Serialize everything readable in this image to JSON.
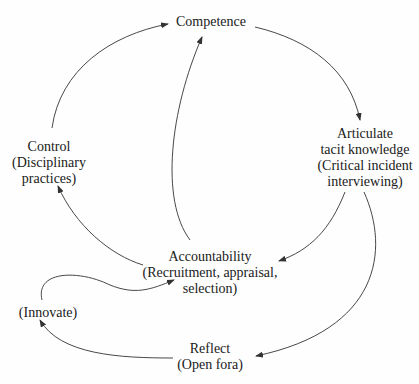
{
  "diagram": {
    "type": "cycle-flow",
    "nodes": {
      "competence": {
        "lines": [
          "Competence"
        ]
      },
      "articulate": {
        "lines": [
          "Articulate",
          "tacit knowledge",
          "(Critical incident",
          "interviewing)"
        ]
      },
      "accountability": {
        "lines": [
          "Accountability",
          "(Recruitment, appraisal,",
          "selection)"
        ]
      },
      "control": {
        "lines": [
          "Control",
          "(Disciplinary",
          "practices)"
        ]
      },
      "innovate": {
        "lines": [
          "(Innovate)"
        ]
      },
      "reflect": {
        "lines": [
          "Reflect",
          "(Open fora)"
        ]
      }
    },
    "edges": [
      {
        "from": "Competence",
        "to": "Articulate tacit knowledge"
      },
      {
        "from": "Articulate tacit knowledge",
        "to": "Accountability"
      },
      {
        "from": "Articulate tacit knowledge",
        "to": "Reflect"
      },
      {
        "from": "Accountability",
        "to": "Control"
      },
      {
        "from": "Accountability",
        "to": "Competence"
      },
      {
        "from": "Control",
        "to": "Competence"
      },
      {
        "from": "Reflect",
        "to": "Innovate"
      },
      {
        "from": "Innovate",
        "to": "Accountability"
      }
    ],
    "colors": {
      "line": "#333333",
      "text": "#1a1a1a",
      "background": "#fefefe"
    }
  }
}
